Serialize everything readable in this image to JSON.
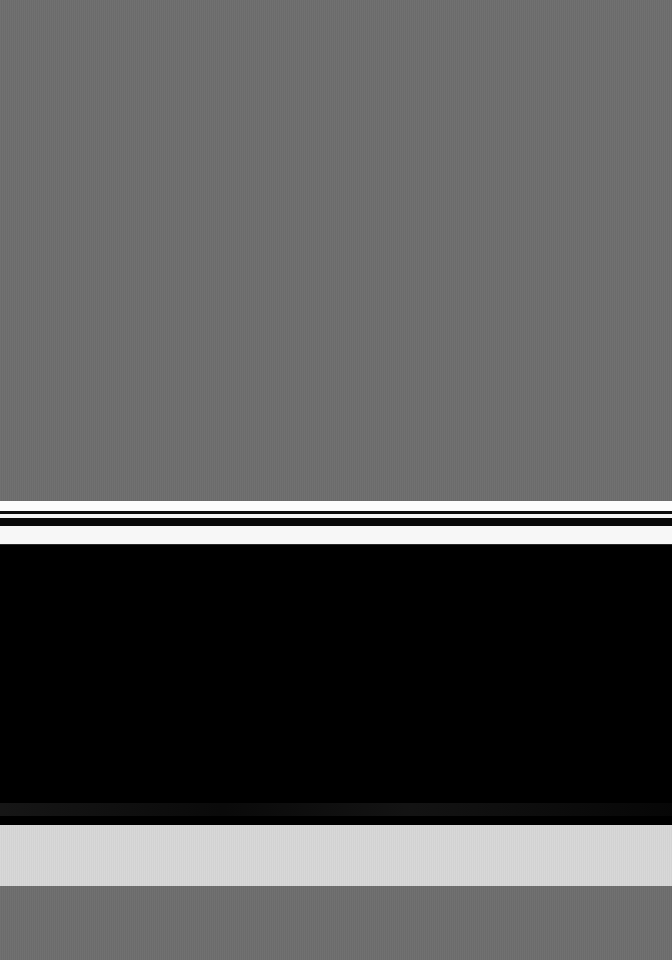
{
  "screen": {
    "width": 672,
    "height": 960,
    "state_label": "loading",
    "has_visible_text": false,
    "description": "Screen captured mid-transition: dimmed gray overlay with a horizontal stripe separator and a blank black content panel."
  },
  "colors": {
    "scrim_gray": "#6e6e6e",
    "panel_black": "#000000",
    "stripe_white": "#fdfdfd",
    "stripe_dark": "#0b0b0b",
    "light_band": "#d7d7d7",
    "edge_line": "#2a2a2a"
  },
  "regions": {
    "scrim_top": {
      "name": "dimmed-overlay-top",
      "y": 0,
      "height": 501,
      "color": "#6e6e6e"
    },
    "separator": {
      "name": "stripe-separator",
      "y": 501,
      "height": 44,
      "stripes": [
        {
          "label": "white-a",
          "y": 0,
          "height": 10,
          "color": "#fdfdfd"
        },
        {
          "label": "dark-a",
          "y": 10,
          "height": 3,
          "color": "#0b0b0b"
        },
        {
          "label": "white-b",
          "y": 13,
          "height": 4,
          "color": "#f4f4f4"
        },
        {
          "label": "dark-b",
          "y": 17,
          "height": 8,
          "color": "#080808"
        },
        {
          "label": "white-c",
          "y": 25,
          "height": 18,
          "color": "#f7f7f7"
        },
        {
          "label": "edge",
          "y": 43,
          "height": 1,
          "color": "#2a2a2a"
        }
      ]
    },
    "content_panel": {
      "name": "blank-content-panel",
      "y": 545,
      "height": 280,
      "color": "#000000",
      "content": ""
    },
    "light_band": {
      "name": "light-band",
      "y": 825,
      "height": 61,
      "color": "#d7d7d7"
    },
    "scrim_bottom": {
      "name": "dimmed-overlay-bottom",
      "y": 886,
      "height": 74,
      "color": "#6e6e6e"
    }
  }
}
